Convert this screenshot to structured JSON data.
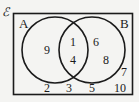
{
  "diagram": {
    "type": "venn-2-set",
    "universal_set_symbol": "ℰ",
    "set_a_label": "A",
    "set_b_label": "B",
    "stroke_color": "#1b1b1b",
    "background_color": "#f4f4f2",
    "text_color": "#1b1b1b"
  },
  "regions": {
    "a_only": {
      "name": "A only",
      "elements": [
        "9"
      ]
    },
    "intersection": {
      "name": "A intersect B",
      "elements": [
        "1",
        "4"
      ]
    },
    "b_only": {
      "name": "B only",
      "elements": [
        "6",
        "8"
      ]
    },
    "outside": {
      "name": "Outside A and B",
      "elements": [
        "2",
        "3",
        "5",
        "7",
        "10"
      ]
    }
  },
  "elements": {
    "a9": "9",
    "i1": "1",
    "i4": "4",
    "b6": "6",
    "b8": "8",
    "o2": "2",
    "o3": "3",
    "o5": "5",
    "o7": "7",
    "o10": "10"
  }
}
